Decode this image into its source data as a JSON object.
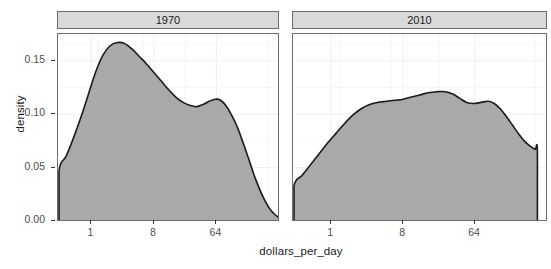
{
  "chart_data": {
    "type": "area",
    "title": "",
    "xlabel": "dollars_per_day",
    "ylabel": "density",
    "facet_variable": "year",
    "facets": [
      {
        "label": "1970",
        "xticks": [
          1,
          8,
          64
        ],
        "xtick_labels": [
          "1",
          "8",
          "64"
        ],
        "x_log_base": 2,
        "xlim_log2": [
          -1.55,
          9.0
        ],
        "ylim": [
          0.0,
          0.175
        ],
        "curve": [
          {
            "x_log2": -1.55,
            "density": 0.0
          },
          {
            "x_log2": -1.55,
            "density": 0.047
          },
          {
            "x_log2": -1.2,
            "density": 0.061
          },
          {
            "x_log2": -0.85,
            "density": 0.078
          },
          {
            "x_log2": -0.5,
            "density": 0.097
          },
          {
            "x_log2": -0.15,
            "density": 0.118
          },
          {
            "x_log2": 0.2,
            "density": 0.139
          },
          {
            "x_log2": 0.55,
            "density": 0.155
          },
          {
            "x_log2": 0.9,
            "density": 0.164
          },
          {
            "x_log2": 1.25,
            "density": 0.167
          },
          {
            "x_log2": 1.6,
            "density": 0.166
          },
          {
            "x_log2": 1.95,
            "density": 0.161
          },
          {
            "x_log2": 2.3,
            "density": 0.154
          },
          {
            "x_log2": 2.65,
            "density": 0.147
          },
          {
            "x_log2": 3.0,
            "density": 0.139
          },
          {
            "x_log2": 3.35,
            "density": 0.131
          },
          {
            "x_log2": 3.7,
            "density": 0.123
          },
          {
            "x_log2": 4.05,
            "density": 0.116
          },
          {
            "x_log2": 4.4,
            "density": 0.111
          },
          {
            "x_log2": 4.75,
            "density": 0.108
          },
          {
            "x_log2": 5.05,
            "density": 0.107
          },
          {
            "x_log2": 5.35,
            "density": 0.109
          },
          {
            "x_log2": 5.65,
            "density": 0.112
          },
          {
            "x_log2": 5.95,
            "density": 0.114
          },
          {
            "x_log2": 6.2,
            "density": 0.113
          },
          {
            "x_log2": 6.45,
            "density": 0.108
          },
          {
            "x_log2": 6.7,
            "density": 0.1
          },
          {
            "x_log2": 7.0,
            "density": 0.088
          },
          {
            "x_log2": 7.3,
            "density": 0.072
          },
          {
            "x_log2": 7.6,
            "density": 0.055
          },
          {
            "x_log2": 7.9,
            "density": 0.038
          },
          {
            "x_log2": 8.2,
            "density": 0.024
          },
          {
            "x_log2": 8.5,
            "density": 0.013
          },
          {
            "x_log2": 8.75,
            "density": 0.007
          },
          {
            "x_log2": 9.0,
            "density": 0.003
          }
        ]
      },
      {
        "label": "2010",
        "xticks": [
          1,
          8,
          64
        ],
        "xtick_labels": [
          "1",
          "8",
          "64"
        ],
        "x_log_base": 2,
        "xlim_log2": [
          -1.55,
          9.0
        ],
        "ylim": [
          0.0,
          0.175
        ],
        "curve": [
          {
            "x_log2": -1.55,
            "density": 0.0
          },
          {
            "x_log2": -1.55,
            "density": 0.033
          },
          {
            "x_log2": -1.2,
            "density": 0.043
          },
          {
            "x_log2": -0.85,
            "density": 0.053
          },
          {
            "x_log2": -0.5,
            "density": 0.063
          },
          {
            "x_log2": -0.15,
            "density": 0.073
          },
          {
            "x_log2": 0.2,
            "density": 0.082
          },
          {
            "x_log2": 0.55,
            "density": 0.091
          },
          {
            "x_log2": 0.9,
            "density": 0.099
          },
          {
            "x_log2": 1.25,
            "density": 0.105
          },
          {
            "x_log2": 1.6,
            "density": 0.109
          },
          {
            "x_log2": 1.95,
            "density": 0.111
          },
          {
            "x_log2": 2.3,
            "density": 0.112
          },
          {
            "x_log2": 2.65,
            "density": 0.113
          },
          {
            "x_log2": 3.0,
            "density": 0.114
          },
          {
            "x_log2": 3.35,
            "density": 0.116
          },
          {
            "x_log2": 3.7,
            "density": 0.118
          },
          {
            "x_log2": 4.05,
            "density": 0.12
          },
          {
            "x_log2": 4.4,
            "density": 0.121
          },
          {
            "x_log2": 4.75,
            "density": 0.121
          },
          {
            "x_log2": 5.05,
            "density": 0.119
          },
          {
            "x_log2": 5.35,
            "density": 0.115
          },
          {
            "x_log2": 5.65,
            "density": 0.111
          },
          {
            "x_log2": 5.95,
            "density": 0.11
          },
          {
            "x_log2": 6.25,
            "density": 0.111
          },
          {
            "x_log2": 6.55,
            "density": 0.112
          },
          {
            "x_log2": 6.8,
            "density": 0.11
          },
          {
            "x_log2": 7.05,
            "density": 0.105
          },
          {
            "x_log2": 7.3,
            "density": 0.098
          },
          {
            "x_log2": 7.55,
            "density": 0.09
          },
          {
            "x_log2": 7.8,
            "density": 0.082
          },
          {
            "x_log2": 8.05,
            "density": 0.075
          },
          {
            "x_log2": 8.3,
            "density": 0.07
          },
          {
            "x_log2": 8.5,
            "density": 0.067
          },
          {
            "x_log2": 8.6,
            "density": 0.066
          },
          {
            "x_log2": 8.6,
            "density": 0.0
          }
        ]
      }
    ],
    "yticks": [
      0.0,
      0.05,
      0.1,
      0.15
    ],
    "ytick_labels": [
      "0.00",
      "0.05",
      "0.10",
      "0.15"
    ],
    "grid": true,
    "legend": "none",
    "fill_color": "#a9a9a9",
    "line_color": "#1a1a1a",
    "panel_border_color": "#6e6e6e",
    "strip_background": "#d9d9d9",
    "grid_color": "#f2f2f2"
  }
}
